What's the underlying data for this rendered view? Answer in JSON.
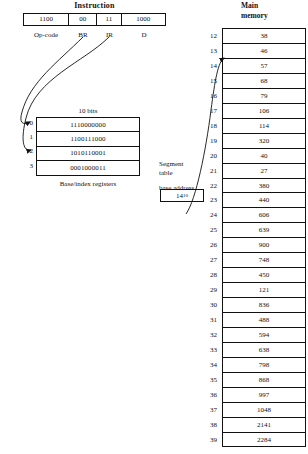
{
  "instruction": {
    "title": "Instruction",
    "fields": [
      {
        "value": "1100",
        "label": "Op-code"
      },
      {
        "value": "00",
        "label": "BR"
      },
      {
        "value": "11",
        "label": "IR"
      },
      {
        "value": "1000",
        "label": "D"
      }
    ]
  },
  "registers": {
    "bits_label": "10 bits",
    "caption": "Base/index registers",
    "rows": [
      {
        "index": "0",
        "value": "1110000000"
      },
      {
        "index": "1",
        "value": "1100111000"
      },
      {
        "index": "2",
        "value": "1010110001"
      },
      {
        "index": "3",
        "value": "0001000011"
      }
    ]
  },
  "segment_table": {
    "label_line1": "Segment",
    "label_line2": "table",
    "label_line3": "base address",
    "value": "14",
    "subscript": "10"
  },
  "main_memory": {
    "title_line1": "Main",
    "title_line2": "memory",
    "rows": [
      {
        "address": "12",
        "value": "38"
      },
      {
        "address": "13",
        "value": "46"
      },
      {
        "address": "14",
        "value": "57"
      },
      {
        "address": "15",
        "value": "68"
      },
      {
        "address": "16",
        "value": "79"
      },
      {
        "address": "17",
        "value": "106"
      },
      {
        "address": "18",
        "value": "114"
      },
      {
        "address": "19",
        "value": "320"
      },
      {
        "address": "20",
        "value": "40"
      },
      {
        "address": "21",
        "value": "27"
      },
      {
        "address": "22",
        "value": "380"
      },
      {
        "address": "23",
        "value": "440"
      },
      {
        "address": "24",
        "value": "606"
      },
      {
        "address": "25",
        "value": "639"
      },
      {
        "address": "26",
        "value": "900"
      },
      {
        "address": "27",
        "value": "748"
      },
      {
        "address": "28",
        "value": "450"
      },
      {
        "address": "29",
        "value": "121"
      },
      {
        "address": "30",
        "value": "836"
      },
      {
        "address": "31",
        "value": "488"
      },
      {
        "address": "32",
        "value": "594"
      },
      {
        "address": "33",
        "value": "638"
      },
      {
        "address": "34",
        "value": "798"
      },
      {
        "address": "35",
        "value": "868"
      },
      {
        "address": "36",
        "value": "997"
      },
      {
        "address": "37",
        "value": "1048"
      },
      {
        "address": "38",
        "value": "2141"
      },
      {
        "address": "39",
        "value": "2284"
      }
    ]
  },
  "colors": {
    "ink": "#111111",
    "paper": "#ffffff"
  }
}
